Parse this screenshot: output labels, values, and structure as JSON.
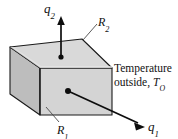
{
  "figure": {
    "name": "heat-flux-slab-diagram",
    "background_color": "#ffffff",
    "width": 178,
    "height": 139,
    "box": {
      "top_face_color": "#d9d9d9",
      "front_face_color": "#d4d4d4",
      "left_face_color": "#bdbdbd",
      "edge_color": "#1a1a1a"
    }
  },
  "labels": {
    "q2": {
      "symbol": "q",
      "subscript": "2"
    },
    "q1": {
      "symbol": "q",
      "subscript": "1"
    },
    "R2": {
      "symbol": "R",
      "subscript": "2"
    },
    "R1": {
      "symbol": "R",
      "subscript": "1"
    },
    "temperature": {
      "line1": "Temperature",
      "line2_prefix": "outside, ",
      "line2_symbol": "T",
      "line2_subscript": "O"
    }
  },
  "arrows": {
    "q2": {
      "direction": "up",
      "origin_face": "top",
      "start": [
        61,
        57
      ],
      "end": [
        61,
        18
      ]
    },
    "q1": {
      "direction": "down-right",
      "origin_face": "front",
      "start": [
        68,
        91
      ],
      "end": [
        143,
        126
      ]
    }
  },
  "leaders": {
    "R2": {
      "from": [
        97,
        23
      ],
      "to": [
        82,
        39
      ]
    },
    "R1": {
      "from": [
        58,
        123
      ],
      "to": [
        45,
        108
      ]
    }
  }
}
